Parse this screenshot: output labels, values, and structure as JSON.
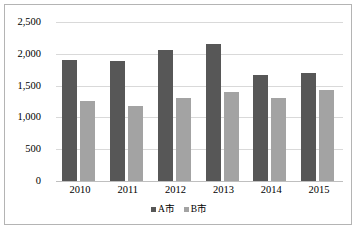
{
  "chart_data": {
    "type": "bar",
    "title": "",
    "xlabel": "",
    "ylabel": "",
    "categories": [
      "2010",
      "2011",
      "2012",
      "2013",
      "2014",
      "2015"
    ],
    "series": [
      {
        "name": "A市",
        "color": "#575757",
        "values": [
          1900,
          1890,
          2060,
          2150,
          1670,
          1700
        ]
      },
      {
        "name": "B市",
        "color": "#a3a3a3",
        "values": [
          1250,
          1180,
          1300,
          1400,
          1300,
          1430
        ]
      }
    ],
    "ylim": [
      0,
      2500
    ],
    "yticks": [
      0,
      500,
      1000,
      1500,
      2000,
      2500
    ],
    "ytick_labels": [
      "0",
      "500",
      "1,000",
      "1,500",
      "2,000",
      "2,500"
    ],
    "grid": true,
    "legend_position": "bottom",
    "annotations": []
  },
  "legend": {
    "items": [
      {
        "label": "A市",
        "swatch": "legend-swatch-a"
      },
      {
        "label": "B市",
        "swatch": "legend-swatch-b"
      }
    ]
  }
}
